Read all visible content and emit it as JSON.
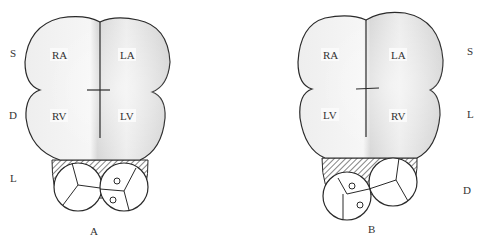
{
  "figures": [
    {
      "id": "A",
      "caption": "A",
      "chambers": {
        "top_left": "RA",
        "top_right": "LA",
        "bottom_left": "RV",
        "bottom_right": "LV"
      },
      "side_labels": [
        "S",
        "D",
        "L"
      ],
      "side": "left"
    },
    {
      "id": "B",
      "caption": "B",
      "chambers": {
        "top_left": "RA",
        "top_right": "LA",
        "bottom_left": "LV",
        "bottom_right": "RV"
      },
      "side_labels": [
        "S",
        "L",
        "D"
      ],
      "side": "right"
    }
  ],
  "colors": {
    "outline": "#2a2a2a",
    "shade_light": "#f2f2f2",
    "shade_dark": "#cfcfcf",
    "label_box": "#fafafa"
  }
}
